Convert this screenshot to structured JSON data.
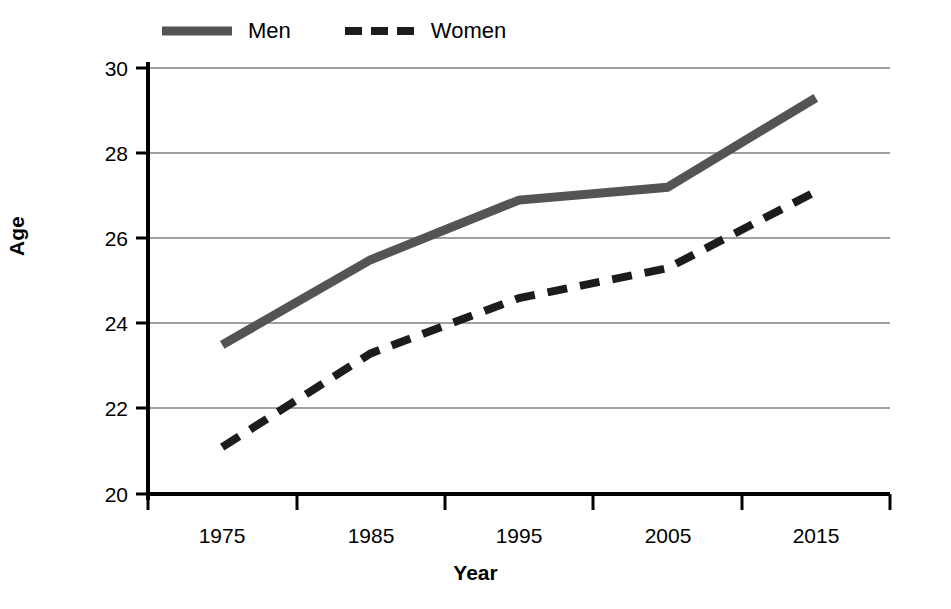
{
  "legend": {
    "position": "top",
    "entries": [
      {
        "label": "Men",
        "style": "solid",
        "color": "#545454",
        "swatch_name": "legend-swatch-men"
      },
      {
        "label": "Women",
        "style": "dashed",
        "color": "#1c1c1c",
        "swatch_name": "legend-swatch-women"
      }
    ]
  },
  "axes": {
    "y_label": "Age",
    "x_label": "Year",
    "y_ticks": [
      "20",
      "22",
      "24",
      "26",
      "28",
      "30"
    ],
    "x_ticks": [
      "1975",
      "1985",
      "1995",
      "2005",
      "2015"
    ]
  },
  "chart_data": {
    "type": "line",
    "title": "",
    "xlabel": "Year",
    "ylabel": "Age",
    "categories": [
      "1975",
      "1985",
      "1995",
      "2005",
      "2015"
    ],
    "x": [
      1975,
      1985,
      1995,
      2005,
      2015
    ],
    "xlim": [
      1970,
      2020
    ],
    "ylim": [
      20,
      30
    ],
    "ytick_values": [
      20,
      22,
      24,
      26,
      28,
      30
    ],
    "grid": "horizontal",
    "legend_position": "top",
    "series": [
      {
        "name": "Men",
        "values": [
          23.5,
          25.5,
          26.9,
          27.2,
          29.3
        ],
        "color": "#545454",
        "style": "solid",
        "width": 9
      },
      {
        "name": "Women",
        "values": [
          21.1,
          23.3,
          24.6,
          25.3,
          27.1
        ],
        "color": "#1c1c1c",
        "style": "dashed",
        "width": 8
      }
    ]
  },
  "geometry": {
    "plot_left": 148,
    "plot_right": 890,
    "plot_top": 68,
    "plot_bottom": 494
  }
}
